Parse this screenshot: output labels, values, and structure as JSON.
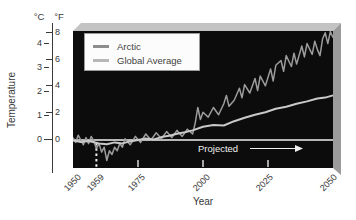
{
  "figure": {
    "y_axis_title": "Temperature",
    "x_axis_title": "Year",
    "c_unit": "°C",
    "f_unit": "°F",
    "c_ticks": [
      "4",
      "3",
      "2",
      "1",
      "0"
    ],
    "f_ticks": [
      "8",
      "6",
      "4",
      "2",
      "0"
    ],
    "x_tick_labels": [
      "1950",
      "1959",
      "1975",
      "2000",
      "2025",
      "2050"
    ],
    "projected_label": "Projected",
    "colors": {
      "plot_background": "#0c0c0c",
      "top_bevel": "#c3c3c3",
      "right_bevel": "#9b9b9b",
      "zero_line": "#f0f0f0",
      "arctic_line": "#9c9c9c",
      "global_line": "#c9c9c9"
    }
  },
  "chart_data": {
    "type": "line",
    "title": "",
    "xlabel": "Year",
    "ylabel": "Temperature",
    "x_range": [
      1950,
      2050
    ],
    "y_range_celsius": [
      -1.2,
      4.55
    ],
    "x_ticks": [
      1950,
      1959,
      1975,
      2000,
      2025,
      2050
    ],
    "y_ticks_celsius": [
      0,
      1,
      2,
      3,
      4
    ],
    "y_ticks_fahrenheit": [
      0,
      2,
      4,
      6,
      8
    ],
    "grid": false,
    "legend_position": "upper-left",
    "plot_background": "black",
    "zero_line": true,
    "annotations": {
      "dashed_vline_year": 1959,
      "projected_text": "Projected",
      "projected_arrow_from_year": 2018,
      "projected_arrow_to_year": 2038
    },
    "series": [
      {
        "name": "Arctic",
        "color": "#9c9c9c",
        "x": [
          1950,
          1951,
          1952,
          1953,
          1954,
          1955,
          1956,
          1957,
          1958,
          1959,
          1960,
          1961,
          1962,
          1963,
          1964,
          1965,
          1966,
          1967,
          1968,
          1969,
          1970,
          1972,
          1974,
          1976,
          1978,
          1980,
          1982,
          1984,
          1986,
          1988,
          1990,
          1992,
          1994,
          1996,
          1997,
          1998,
          1999,
          2000,
          2002,
          2004,
          2006,
          2008,
          2009,
          2010,
          2012,
          2014,
          2015,
          2016,
          2018,
          2020,
          2021,
          2022,
          2024,
          2026,
          2027,
          2028,
          2030,
          2031,
          2032,
          2034,
          2035,
          2036,
          2038,
          2039,
          2040,
          2042,
          2043,
          2044,
          2045,
          2046,
          2047,
          2048,
          2049,
          2050
        ],
        "y": [
          0.1,
          -0.1,
          0.2,
          0.0,
          -0.2,
          0.1,
          -0.15,
          0.15,
          -0.05,
          -0.35,
          -0.15,
          -0.5,
          -0.3,
          -0.85,
          -0.45,
          -0.6,
          -0.3,
          -0.45,
          -0.15,
          -0.3,
          0.05,
          -0.2,
          0.15,
          -0.1,
          0.25,
          0.0,
          0.3,
          0.05,
          0.35,
          0.1,
          0.4,
          0.15,
          0.45,
          0.25,
          0.7,
          1.35,
          0.85,
          1.15,
          0.95,
          1.35,
          1.05,
          1.5,
          1.85,
          1.4,
          1.65,
          2.15,
          1.75,
          2.3,
          1.95,
          2.55,
          2.05,
          2.65,
          2.25,
          2.95,
          2.45,
          3.1,
          3.3,
          2.85,
          3.5,
          3.05,
          3.6,
          3.15,
          3.9,
          3.45,
          4.0,
          3.55,
          4.1,
          3.75,
          3.5,
          4.2,
          4.45,
          4.0,
          4.5,
          4.25
        ]
      },
      {
        "name": "Global Average",
        "color": "#c9c9c9",
        "x": [
          1950,
          1953,
          1956,
          1960,
          1963,
          1966,
          1969,
          1972,
          1975,
          1978,
          1981,
          1984,
          1987,
          1990,
          1993,
          1996,
          2000,
          2004,
          2008,
          2012,
          2016,
          2020,
          2024,
          2028,
          2032,
          2036,
          2040,
          2044,
          2047,
          2050
        ],
        "y": [
          -0.02,
          -0.08,
          -0.04,
          -0.14,
          -0.18,
          -0.1,
          -0.14,
          -0.06,
          0.0,
          0.06,
          0.02,
          0.12,
          0.18,
          0.26,
          0.32,
          0.4,
          0.55,
          0.62,
          0.6,
          0.78,
          0.92,
          1.05,
          1.15,
          1.3,
          1.38,
          1.5,
          1.6,
          1.72,
          1.76,
          1.85
        ]
      }
    ]
  }
}
